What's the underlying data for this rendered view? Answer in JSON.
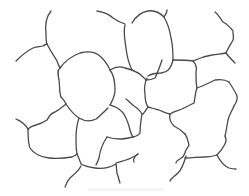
{
  "diagram": {
    "type": "cell-boundary line drawing",
    "background": "#ffffff",
    "stroke_color": "#4a4a4a",
    "stroke_width": 1.3,
    "edges": [
      {
        "id": "e1",
        "d": "M51,11 C46,17 45,26 46,34 C46,38 46,42 47,44"
      },
      {
        "id": "e2",
        "d": "M16,61 C22,55 27,51 33,48 C37,46 40,47 43,46 C45,45 46,44 47,44"
      },
      {
        "id": "e3",
        "d": "M47,44 C50,50 54,56 57,61 C58,64 59,66 60,68"
      },
      {
        "id": "e4",
        "d": "M60,68 C65,61 72,56 80,53 C88,51 96,52 101,57 C105,61 108,65 110,70"
      },
      {
        "id": "e5",
        "d": "M60,68 C57,70 58,75 59,80 C60,86 59,92 61,97"
      },
      {
        "id": "e6",
        "d": "M61,97 C63,99 65,101 66,104"
      },
      {
        "id": "e7",
        "d": "M110,70 C114,75 115,82 115,90 C115,97 112,101 110,105"
      },
      {
        "id": "e8",
        "d": "M110,70 C115,67 120,66 125,68"
      },
      {
        "id": "e9",
        "d": "M97,11 C103,12 109,14 113,18 C117,21 122,23 125,24"
      },
      {
        "id": "e10",
        "d": "M125,25 C123,32 125,40 126,48 C127,57 129,64 132,70"
      },
      {
        "id": "e11",
        "d": "M125,68 C129,69 133,70 136,72 C140,73 143,77 146,80"
      },
      {
        "id": "e12",
        "d": "M132,23 C136,16 142,12 148,11 C154,10 160,13 164,17 C166,14 167,12 167,10"
      },
      {
        "id": "e13",
        "d": "M164,17 C168,24 170,31 171,38 C173,46 173,53 173,60"
      },
      {
        "id": "e14",
        "d": "M148,76 C151,74 155,73 161,73 C165,72 170,72 173,60"
      },
      {
        "id": "e15",
        "d": "M146,80 C150,80 153,79 155,78 C158,72 160,66 162,60"
      },
      {
        "id": "e16",
        "d": "M173,60 C180,60 186,60 193,61 C196,64 197,68 196,72 C196,78 196,84 197,88"
      },
      {
        "id": "e17",
        "d": "M193,61 C199,58 205,56 212,55 C217,54 222,54 226,53"
      },
      {
        "id": "e18",
        "d": "M226,53 C228,48 231,44 233,40 C234,37 233,34 233,32"
      },
      {
        "id": "e19",
        "d": "M233,31 C230,27 227,24 223,22 C220,18 219,15 215,12"
      },
      {
        "id": "e20",
        "d": "M226,53 C229,57 232,60 235,63"
      },
      {
        "id": "e21",
        "d": "M147,78 C145,82 144,88 145,94 C145,99 146,104 148,107 C146,110 145,112 143,114"
      },
      {
        "id": "e22",
        "d": "M197,88 C195,93 195,99 194,103 C190,105 186,107 182,109 C177,111 173,112 170,114"
      },
      {
        "id": "e23",
        "d": "M170,114 C165,113 162,111 159,110 C155,109 152,108 148,107"
      },
      {
        "id": "e24",
        "d": "M197,88 C203,86 209,83 215,80 C221,79 226,80 229,82"
      },
      {
        "id": "e25",
        "d": "M229,82 C232,87 235,91 237,96 C238,100 236,103 234,106"
      },
      {
        "id": "e26",
        "d": "M234,106 C232,111 229,115 228,120 C227,126 226,132 225,136"
      },
      {
        "id": "e27",
        "d": "M142,114 C140,111 138,108 134,106 C130,103 128,100 126,99"
      },
      {
        "id": "e28",
        "d": "M110,105 C113,106 117,107 120,110 C125,113 127,120 129,126 C130,131 131,134 133,137"
      },
      {
        "id": "e29",
        "d": "M142,114 C141,120 140,127 140,133 C139,135 137,136 133,137"
      },
      {
        "id": "e30",
        "d": "M133,137 C128,138 124,139 120,139 C115,139 110,138 107,137"
      },
      {
        "id": "e31",
        "d": "M107,137 C103,143 100,150 99,158 C98,161 97,163 96,165"
      },
      {
        "id": "e32",
        "d": "M66,104 C62,107 59,110 55,112 C51,113 49,116 47,120 C44,122 40,124 36,125 C32,126 30,127 28,129"
      },
      {
        "id": "e33",
        "d": "M28,129 C24,122 20,121 16,119"
      },
      {
        "id": "e34",
        "d": "M28,129 C28,136 28,143 30,148 C34,154 40,157 49,158 C58,159 66,158 72,157 C74,156 76,155 77,154"
      },
      {
        "id": "e35",
        "d": "M66,104 C70,110 74,115 79,118 C84,121 90,122 96,119 C100,116 103,113 108,108"
      },
      {
        "id": "e36",
        "d": "M79,118 C77,124 76,131 76,138 C76,143 76,149 77,154"
      },
      {
        "id": "e37",
        "d": "M77,154 C79,158 80,161 81,164 C84,166 89,167 95,168 C101,169 109,168 116,164"
      },
      {
        "id": "e38",
        "d": "M81,166 C78,172 73,175 70,178 C67,181 66,184 65,187"
      },
      {
        "id": "e39",
        "d": "M116,164 C117,168 116,173 118,176 C119,180 120,183 120,183"
      },
      {
        "id": "e40",
        "d": "M116,163 C122,161 128,160 133,157 C136,156 137,155 138,154"
      },
      {
        "id": "e41",
        "d": "M138,154 C134,156 133,160 134,162"
      },
      {
        "id": "e42",
        "d": "M170,114 C169,118 171,123 174,126 C178,128 182,131 185,134"
      },
      {
        "id": "e43",
        "d": "M185,134 C188,138 188,142 189,145 C188,148 185,150 185,153 C184,156 182,158 180,159 C178,160 176,161 176,163"
      },
      {
        "id": "e44",
        "d": "M185,158 C192,158 199,157 205,157 C210,157 214,156 217,155"
      },
      {
        "id": "e45",
        "d": "M217,155 C220,152 223,148 225,144 C227,140 226,138 225,136"
      },
      {
        "id": "e46",
        "d": "M217,155 C220,161 224,166 229,168 C232,169 235,169 236,169"
      },
      {
        "id": "e47",
        "d": "M186,156 C184,163 182,169 178,173 C174,177 171,178 170,181"
      }
    ]
  },
  "watermark": {
    "text": "",
    "note_visible": "faint illegible watermark line at bottom center"
  }
}
